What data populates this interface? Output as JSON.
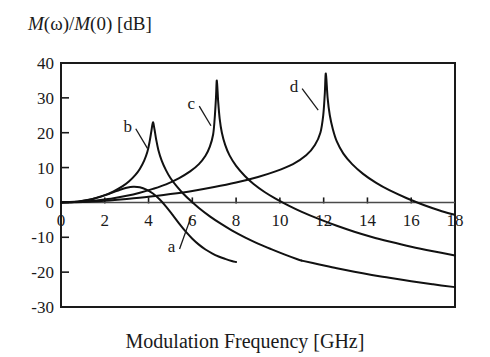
{
  "chart_data": {
    "type": "line",
    "title": "",
    "xlabel": "Modulation Frequency [GHz]",
    "ylabel": "M(ω)/M(0) [dB]",
    "ylabel_parts": {
      "m1": "M",
      "omega": "(ω)/",
      "m2": "M",
      "zero": "(0) [dB]"
    },
    "xlim": [
      0,
      18
    ],
    "ylim": [
      -30,
      40
    ],
    "xticks": [
      0,
      2,
      4,
      6,
      8,
      10,
      12,
      14,
      16,
      18
    ],
    "xticklabels": [
      "0",
      "2",
      "4",
      "6",
      "8",
      "10",
      "12",
      "14",
      "16",
      "18"
    ],
    "yticks": [
      -30,
      -20,
      -10,
      0,
      10,
      20,
      30,
      40
    ],
    "yticklabels": [
      "-30",
      "-20",
      "-10",
      "0",
      "10",
      "20",
      "30",
      "40"
    ],
    "grid": false,
    "legend": "none",
    "zero_line": true,
    "frame": "box",
    "annotations": [
      {
        "label": "a",
        "x": 5.05,
        "y": -12.5,
        "point_x": 5.95,
        "point_y": -4.0
      },
      {
        "label": "b",
        "x": 3.05,
        "y": 22.0,
        "point_x": 3.95,
        "point_y": 15.5
      },
      {
        "label": "c",
        "x": 5.95,
        "y": 28.5,
        "point_x": 6.85,
        "point_y": 22.0
      },
      {
        "label": "d",
        "x": 10.65,
        "y": 33.5,
        "point_x": 11.75,
        "point_y": 26.5
      }
    ],
    "series": [
      {
        "name": "a",
        "peak_frequency": 3.3,
        "peak_value": 4.5,
        "damped": true,
        "points": [
          [
            0.0,
            0.0
          ],
          [
            0.3,
            0.05
          ],
          [
            0.6,
            0.15
          ],
          [
            0.9,
            0.35
          ],
          [
            1.2,
            0.65
          ],
          [
            1.5,
            1.05
          ],
          [
            1.8,
            1.6
          ],
          [
            2.1,
            2.25
          ],
          [
            2.4,
            2.95
          ],
          [
            2.7,
            3.65
          ],
          [
            3.0,
            4.2
          ],
          [
            3.3,
            4.5
          ],
          [
            3.6,
            4.35
          ],
          [
            3.9,
            3.7
          ],
          [
            4.2,
            2.55
          ],
          [
            4.5,
            0.9
          ],
          [
            4.8,
            -1.2
          ],
          [
            5.1,
            -3.6
          ],
          [
            5.4,
            -6.1
          ],
          [
            5.7,
            -8.4
          ],
          [
            6.0,
            -10.4
          ],
          [
            6.3,
            -12.1
          ],
          [
            6.6,
            -13.5
          ],
          [
            6.9,
            -14.6
          ],
          [
            7.2,
            -15.5
          ],
          [
            7.5,
            -16.2
          ],
          [
            7.8,
            -16.8
          ],
          [
            8.0,
            -17.1
          ]
        ]
      },
      {
        "name": "b",
        "peak_frequency": 4.2,
        "peak_value": 23.0,
        "damped": false,
        "points": [
          [
            0.0,
            0.0
          ],
          [
            0.4,
            0.1
          ],
          [
            0.8,
            0.3
          ],
          [
            1.2,
            0.7
          ],
          [
            1.6,
            1.3
          ],
          [
            2.0,
            2.1
          ],
          [
            2.4,
            3.2
          ],
          [
            2.8,
            4.6
          ],
          [
            3.1,
            6.0
          ],
          [
            3.4,
            7.9
          ],
          [
            3.6,
            9.6
          ],
          [
            3.8,
            12.0
          ],
          [
            3.95,
            14.6
          ],
          [
            4.05,
            17.5
          ],
          [
            4.13,
            20.5
          ],
          [
            4.2,
            23.0
          ],
          [
            4.27,
            21.0
          ],
          [
            4.35,
            18.0
          ],
          [
            4.45,
            15.0
          ],
          [
            4.6,
            12.0
          ],
          [
            4.8,
            9.2
          ],
          [
            5.0,
            7.0
          ],
          [
            5.3,
            4.5
          ],
          [
            5.6,
            2.4
          ],
          [
            5.9,
            0.6
          ],
          [
            6.3,
            -1.6
          ],
          [
            6.8,
            -4.0
          ],
          [
            7.3,
            -6.1
          ],
          [
            7.8,
            -8.0
          ],
          [
            8.4,
            -10.0
          ],
          [
            9.0,
            -11.8
          ],
          [
            9.6,
            -13.4
          ],
          [
            10.2,
            -14.9
          ],
          [
            10.8,
            -16.3
          ],
          [
            11.0,
            -16.7
          ]
        ]
      },
      {
        "name": "c",
        "peak_frequency": 7.1,
        "peak_value": 35.0,
        "damped": false,
        "points": [
          [
            0.0,
            0.0
          ],
          [
            0.6,
            0.1
          ],
          [
            1.2,
            0.3
          ],
          [
            1.8,
            0.7
          ],
          [
            2.4,
            1.2
          ],
          [
            3.0,
            1.9
          ],
          [
            3.6,
            2.8
          ],
          [
            4.2,
            3.9
          ],
          [
            4.8,
            5.2
          ],
          [
            5.4,
            7.0
          ],
          [
            5.9,
            8.9
          ],
          [
            6.3,
            11.0
          ],
          [
            6.6,
            13.4
          ],
          [
            6.8,
            16.0
          ],
          [
            6.95,
            19.5
          ],
          [
            7.02,
            24.0
          ],
          [
            7.08,
            30.0
          ],
          [
            7.12,
            35.0
          ],
          [
            7.18,
            29.0
          ],
          [
            7.25,
            24.0
          ],
          [
            7.35,
            20.0
          ],
          [
            7.5,
            16.5
          ],
          [
            7.7,
            13.5
          ],
          [
            8.0,
            10.5
          ],
          [
            8.4,
            7.6
          ],
          [
            8.8,
            5.3
          ],
          [
            9.3,
            3.0
          ],
          [
            9.8,
            1.1
          ],
          [
            10.4,
            -0.9
          ],
          [
            11.0,
            -2.7
          ],
          [
            11.8,
            -4.8
          ],
          [
            12.6,
            -6.7
          ],
          [
            13.4,
            -8.4
          ],
          [
            14.2,
            -9.9
          ],
          [
            15.0,
            -11.2
          ],
          [
            16.0,
            -12.7
          ],
          [
            17.0,
            -14.0
          ],
          [
            18.0,
            -15.2
          ]
        ]
      },
      {
        "name": "d",
        "peak_frequency": 12.1,
        "peak_value": 37.0,
        "damped": false,
        "points": [
          [
            0.0,
            0.0
          ],
          [
            1.0,
            0.15
          ],
          [
            2.0,
            0.5
          ],
          [
            3.0,
            1.0
          ],
          [
            4.0,
            1.6
          ],
          [
            5.0,
            2.4
          ],
          [
            6.0,
            3.3
          ],
          [
            7.0,
            4.4
          ],
          [
            8.0,
            5.7
          ],
          [
            9.0,
            7.3
          ],
          [
            9.8,
            8.9
          ],
          [
            10.6,
            11.0
          ],
          [
            11.2,
            13.5
          ],
          [
            11.6,
            16.5
          ],
          [
            11.85,
            20.0
          ],
          [
            11.98,
            25.0
          ],
          [
            12.05,
            31.0
          ],
          [
            12.1,
            37.0
          ],
          [
            12.18,
            30.0
          ],
          [
            12.28,
            25.0
          ],
          [
            12.42,
            21.0
          ],
          [
            12.6,
            17.5
          ],
          [
            12.9,
            14.0
          ],
          [
            13.3,
            11.0
          ],
          [
            13.8,
            8.2
          ],
          [
            14.4,
            5.6
          ],
          [
            15.0,
            3.5
          ],
          [
            15.8,
            1.2
          ],
          [
            16.6,
            -0.8
          ],
          [
            17.3,
            -2.3
          ],
          [
            18.0,
            -3.6
          ]
        ]
      },
      {
        "name": "lower-tail-1",
        "points": [
          [
            11.0,
            -16.7
          ],
          [
            11.8,
            -17.8
          ],
          [
            12.6,
            -18.9
          ],
          [
            13.4,
            -19.9
          ],
          [
            14.2,
            -20.8
          ],
          [
            15.0,
            -21.6
          ],
          [
            16.0,
            -22.6
          ],
          [
            17.0,
            -23.5
          ],
          [
            18.0,
            -24.3
          ]
        ]
      }
    ]
  },
  "figure": {
    "background_color": "#ffffff",
    "line_color": "#111111",
    "text_color": "#1a1a1a"
  }
}
